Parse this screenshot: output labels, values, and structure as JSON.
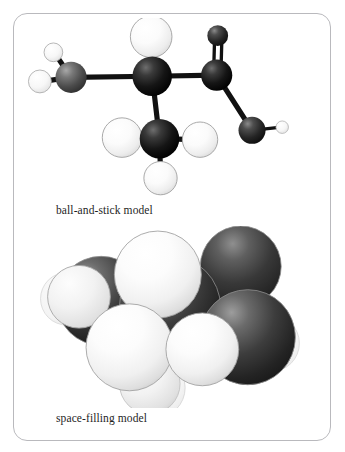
{
  "figure": {
    "background_color": "#ffffff",
    "card_border_color": "#b9b9bd",
    "card_radius_px": 14
  },
  "panels": [
    {
      "id": "ball-and-stick",
      "caption": "ball-and-stick model",
      "model_type": "ball-and-stick",
      "molecule": {
        "name": "3-hydroxy-2-methylpropanal skeleton (2-methyl carbonyl alcohol)",
        "formula_atoms": {
          "carbon": 4,
          "oxygen": 2,
          "hydrogen": 8
        }
      },
      "atom_colors": {
        "carbon_dark": "#141414",
        "carbon_mid": "#4a4a4a",
        "oxygen": "#2b2b2b",
        "hydrogen_large": "#f2f2f2",
        "hydrogen_small": "#fafafa",
        "bond": "#111111",
        "outline": "#8d8d8d"
      },
      "atoms": [
        {
          "label": "C1",
          "element": "C",
          "x": 33,
          "y": 57,
          "r": 15,
          "shade": "carbon_mid"
        },
        {
          "label": "C2",
          "element": "C",
          "x": 111,
          "y": 56,
          "r": 19,
          "shade": "carbon_dark"
        },
        {
          "label": "C3",
          "element": "C",
          "x": 118,
          "y": 116,
          "r": 19,
          "shade": "carbon_dark"
        },
        {
          "label": "C4",
          "element": "C",
          "x": 173,
          "y": 55,
          "r": 15,
          "shade": "carbon_dark"
        },
        {
          "label": "O1",
          "element": "O",
          "x": 174,
          "y": 17,
          "r": 10,
          "shade": "oxygen"
        },
        {
          "label": "O2",
          "element": "O",
          "x": 207,
          "y": 108,
          "r": 13,
          "shade": "oxygen"
        },
        {
          "label": "H1",
          "element": "H",
          "x": 16,
          "y": 33,
          "r": 9,
          "shade": "hydrogen_small"
        },
        {
          "label": "H2",
          "element": "H",
          "x": 2,
          "y": 61,
          "r": 11,
          "shade": "hydrogen_small"
        },
        {
          "label": "H3",
          "element": "H",
          "x": 110,
          "y": 18,
          "r": 20,
          "shade": "hydrogen_large"
        },
        {
          "label": "H4",
          "element": "H",
          "x": 82,
          "y": 115,
          "r": 19,
          "shade": "hydrogen_large"
        },
        {
          "label": "H5",
          "element": "H",
          "x": 157,
          "y": 117,
          "r": 17,
          "shade": "hydrogen_large"
        },
        {
          "label": "H6",
          "element": "H",
          "x": 119,
          "y": 154,
          "r": 16,
          "shade": "hydrogen_large"
        },
        {
          "label": "H7",
          "element": "H",
          "x": 234,
          "y": 105,
          "r": 6,
          "shade": "hydrogen_small"
        }
      ],
      "bonds": [
        {
          "from": "C1",
          "to": "C2",
          "order": 1
        },
        {
          "from": "C2",
          "to": "C3",
          "order": 1
        },
        {
          "from": "C2",
          "to": "C4",
          "order": 1
        },
        {
          "from": "C4",
          "to": "O1",
          "order": 2
        },
        {
          "from": "C4",
          "to": "O2",
          "order": 1
        },
        {
          "from": "O2",
          "to": "H7",
          "order": 1
        },
        {
          "from": "C1",
          "to": "H1",
          "order": 1
        },
        {
          "from": "C1",
          "to": "H2",
          "order": 1
        },
        {
          "from": "C2",
          "to": "H3",
          "order": 1
        },
        {
          "from": "C3",
          "to": "H4",
          "order": 1
        },
        {
          "from": "C3",
          "to": "H5",
          "order": 1
        },
        {
          "from": "C3",
          "to": "H6",
          "order": 1
        }
      ]
    },
    {
      "id": "space-filling",
      "caption": "space-filling model",
      "model_type": "space-filling",
      "atom_colors": {
        "carbon": "#3b3b3b",
        "oxygen": "#2e2e2e",
        "hydrogen": "#efefef",
        "outline": "#9a9a9a"
      },
      "spheres": [
        {
          "label": "C-back-right",
          "element": "C",
          "x": 204,
          "y": 42,
          "r": 38,
          "shade": "carbon",
          "z": 1
        },
        {
          "label": "C-left",
          "element": "C",
          "x": 62,
          "y": 72,
          "r": 42,
          "shade": "carbon",
          "z": 2
        },
        {
          "label": "H-left",
          "element": "H",
          "x": 40,
          "y": 70,
          "r": 31,
          "shade": "hydrogen",
          "z": 3
        },
        {
          "label": "C-center",
          "element": "C",
          "x": 130,
          "y": 78,
          "r": 46,
          "shade": "carbon",
          "z": 3
        },
        {
          "label": "C-right",
          "element": "C",
          "x": 208,
          "y": 108,
          "r": 46,
          "shade": "carbon",
          "z": 4
        },
        {
          "label": "H-bottom-bk",
          "element": "H",
          "x": 110,
          "y": 158,
          "r": 30,
          "shade": "hydrogen",
          "z": 4
        },
        {
          "label": "H-top",
          "element": "H",
          "x": 118,
          "y": 48,
          "r": 42,
          "shade": "hydrogen",
          "z": 6
        },
        {
          "label": "H-low-left",
          "element": "H",
          "x": 90,
          "y": 118,
          "r": 42,
          "shade": "hydrogen",
          "z": 7
        },
        {
          "label": "H-low-right",
          "element": "H",
          "x": 162,
          "y": 120,
          "r": 35,
          "shade": "hydrogen",
          "z": 7
        }
      ]
    }
  ]
}
